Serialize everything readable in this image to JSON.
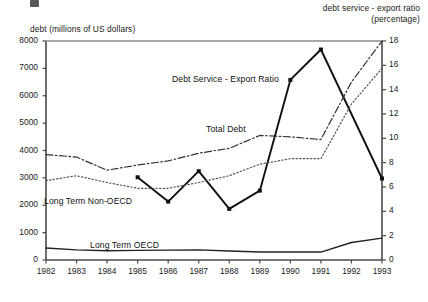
{
  "figure": {
    "artifact_mark_name": "scan-artifact-mark"
  },
  "chart_data": {
    "type": "line",
    "title": "",
    "subtitle": "",
    "xlabel": "",
    "ylabel": "debt (millions of US dollars)",
    "y2label": "debt service - export ratio (percentage)",
    "ylabel_lines": [
      "debt (millions of US dollars)"
    ],
    "y2label_lines": [
      "debt service - export ratio",
      "(percentage)"
    ],
    "grid": false,
    "legend_position": "inline-annotations",
    "x": [
      1982,
      1983,
      1984,
      1985,
      1986,
      1987,
      1988,
      1989,
      1990,
      1991,
      1992,
      1993
    ],
    "xtick_labels": [
      "1982",
      "1983",
      "1984",
      "1985",
      "1986",
      "1987",
      "1988",
      "1989",
      "1990",
      "1991",
      "1992",
      "1993"
    ],
    "xlim": [
      1982,
      1993
    ],
    "ylim": [
      0,
      8000
    ],
    "ytick_labels": [
      "0",
      "1000",
      "2000",
      "3000",
      "4000",
      "5000",
      "6000",
      "7000",
      "8000"
    ],
    "yticks": [
      0,
      1000,
      2000,
      3000,
      4000,
      5000,
      6000,
      7000,
      8000
    ],
    "y2lim": [
      0,
      18
    ],
    "y2tick_labels": [
      "0",
      "2",
      "4",
      "6",
      "8",
      "10",
      "12",
      "14",
      "16",
      "18"
    ],
    "y2ticks": [
      0,
      2,
      4,
      6,
      8,
      10,
      12,
      14,
      16,
      18
    ],
    "series": [
      {
        "name": "Debt Service - Export Ratio",
        "axis": "right",
        "style": "solid",
        "markers": "square",
        "color": "#111111",
        "x": [
          1985,
          1986,
          1987,
          1988,
          1989,
          1990,
          1991,
          1993
        ],
        "values": [
          6.8,
          4.8,
          7.3,
          4.2,
          5.7,
          14.8,
          17.3,
          6.7
        ]
      },
      {
        "name": "Total Debt",
        "axis": "left",
        "style": "dash-dot",
        "markers": "none",
        "color": "#333333",
        "x": [
          1982,
          1983,
          1984,
          1985,
          1986,
          1987,
          1988,
          1989,
          1990,
          1991,
          1992,
          1993
        ],
        "values": [
          3850,
          3760,
          3280,
          3470,
          3620,
          3900,
          4080,
          4550,
          4500,
          4400,
          6500,
          8000
        ]
      },
      {
        "name": "Long Term Non-OECD",
        "axis": "left",
        "style": "dotted",
        "markers": "none",
        "color": "#555555",
        "x": [
          1982,
          1983,
          1984,
          1985,
          1986,
          1987,
          1988,
          1989,
          1990,
          1991,
          1992,
          1993
        ],
        "values": [
          2900,
          3080,
          2830,
          2620,
          2620,
          2830,
          3080,
          3500,
          3700,
          3700,
          5700,
          7000
        ]
      },
      {
        "name": "Long Term OECD",
        "axis": "left",
        "style": "solid-thin",
        "markers": "none",
        "color": "#222222",
        "x": [
          1982,
          1983,
          1984,
          1985,
          1986,
          1987,
          1988,
          1989,
          1990,
          1991,
          1992,
          1993
        ],
        "values": [
          440,
          370,
          340,
          350,
          360,
          370,
          330,
          290,
          290,
          290,
          640,
          800
        ]
      }
    ],
    "annotations": [
      {
        "text": "Debt Service - Export Ratio",
        "x_px": 172,
        "y_px": 74
      },
      {
        "text": "Total Debt",
        "x_px": 206,
        "y_px": 124
      },
      {
        "text": "Long Term Non-OECD",
        "x_px": 44,
        "y_px": 196
      },
      {
        "text": "Long Term OECD",
        "x_px": 90,
        "y_px": 240
      }
    ]
  }
}
